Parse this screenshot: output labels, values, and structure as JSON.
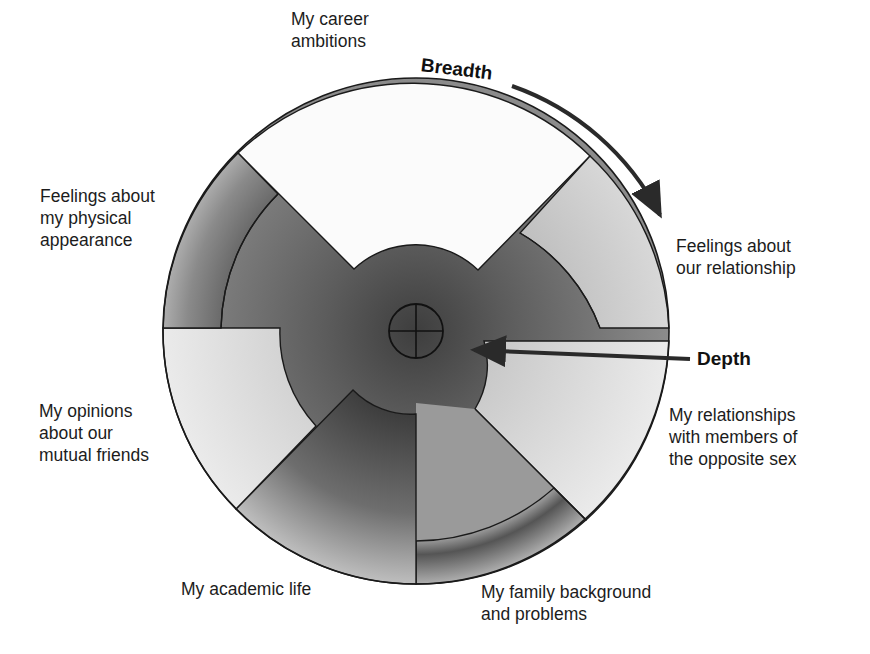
{
  "diagram": {
    "type": "social-penetration-model",
    "axes": {
      "breadth_label": "Breadth",
      "depth_label": "Depth"
    },
    "topics": [
      {
        "id": "career",
        "lines": [
          "My career",
          "ambitions"
        ],
        "depth": "shallow"
      },
      {
        "id": "relationship",
        "lines": [
          "Feelings about",
          "our relationship"
        ],
        "depth": "shallow-medium"
      },
      {
        "id": "opposite-sex",
        "lines": [
          "My relationships",
          "with members of",
          "the opposite sex"
        ],
        "depth": "shallow"
      },
      {
        "id": "family",
        "lines": [
          "My family background",
          "and problems"
        ],
        "depth": "deep"
      },
      {
        "id": "academic",
        "lines": [
          "My academic life"
        ],
        "depth": "deepest"
      },
      {
        "id": "friends",
        "lines": [
          "My opinions",
          "about our",
          "mutual friends"
        ],
        "depth": "shallow-medium"
      },
      {
        "id": "appearance",
        "lines": [
          "Feelings about",
          "my physical",
          "appearance"
        ],
        "depth": "deep"
      }
    ],
    "colors": {
      "outline": "#1a1a1a",
      "arrow": "#2a2a2a",
      "core": "#5a5a5a",
      "light": "#e6e6e6",
      "mid": "#a8a8a8",
      "dark": "#6e6e6e"
    }
  }
}
